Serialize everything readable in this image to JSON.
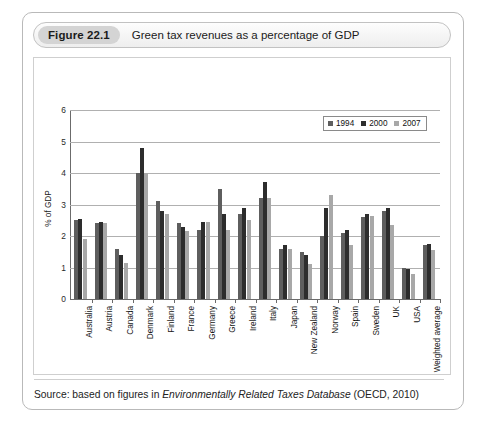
{
  "figure": {
    "number": "Figure 22.1",
    "title": "Green tax revenues as a percentage of GDP",
    "source_prefix": "Source: based on figures in ",
    "source_italic": "Environmentally Related Taxes Database",
    "source_suffix": " (OECD, 2010)"
  },
  "colors": {
    "series_1994": "#5e5e5e",
    "series_2000": "#2d2d2d",
    "series_2007": "#a8a8a8",
    "axis": "#6b6b6b",
    "grid": "#b0b0b0",
    "card_border": "#b9b9b9",
    "title_pill": "#d4d4d4"
  },
  "chart_data": {
    "type": "bar",
    "title": "Green tax revenues as a percentage of GDP",
    "xlabel": "",
    "ylabel": "% of GDP",
    "ylim": [
      0,
      6
    ],
    "yticks": [
      0,
      1,
      2,
      3,
      4,
      5,
      6
    ],
    "grid": true,
    "legend_position": "top-right",
    "categories": [
      "Australia",
      "Austria",
      "Canada",
      "Denmark",
      "Finland",
      "France",
      "Germany",
      "Greece",
      "Ireland",
      "Italy",
      "Japan",
      "New Zealand",
      "Norway",
      "Spain",
      "Sweden",
      "UK",
      "USA",
      "Weighted average"
    ],
    "series": [
      {
        "name": "1994",
        "values": [
          2.5,
          2.4,
          1.6,
          4.0,
          3.1,
          2.4,
          2.2,
          3.5,
          2.7,
          3.2,
          1.6,
          1.5,
          2.0,
          2.1,
          2.6,
          2.8,
          1.0,
          1.7
        ]
      },
      {
        "name": "2000",
        "values": [
          2.55,
          2.45,
          1.4,
          4.8,
          2.8,
          2.3,
          2.45,
          2.7,
          2.9,
          3.7,
          1.7,
          1.4,
          2.9,
          2.2,
          2.7,
          2.9,
          0.95,
          1.75
        ]
      },
      {
        "name": "2007",
        "values": [
          1.9,
          2.4,
          1.15,
          4.0,
          2.7,
          2.15,
          2.45,
          2.2,
          2.5,
          3.2,
          1.6,
          1.1,
          3.3,
          1.7,
          2.65,
          2.35,
          0.8,
          1.55
        ]
      }
    ]
  }
}
